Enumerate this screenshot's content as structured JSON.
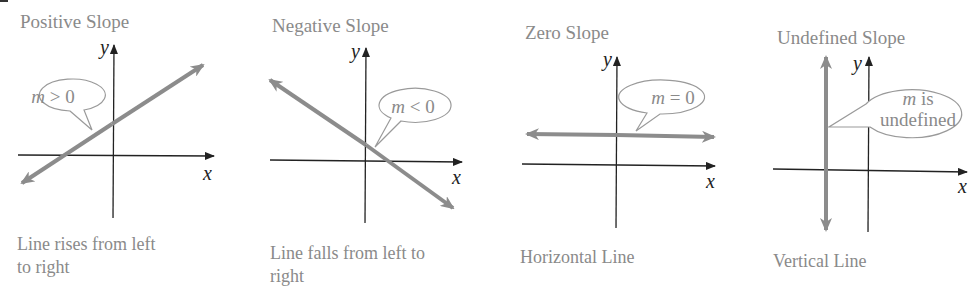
{
  "panels": [
    {
      "title": "Positive Slope",
      "bubble": {
        "var": "m",
        "rel": " > 0"
      },
      "caption_line1": "Line rises from left",
      "caption_line2": "to right",
      "x_label": "x",
      "y_label": "y"
    },
    {
      "title": "Negative Slope",
      "bubble": {
        "var": "m",
        "rel": " < 0"
      },
      "caption_line1": "Line falls from left to",
      "caption_line2": "right",
      "x_label": "x",
      "y_label": "y"
    },
    {
      "title": "Zero Slope",
      "bubble": {
        "var": "m",
        "rel": " = 0"
      },
      "caption_line1": "Horizontal Line",
      "caption_line2": "",
      "x_label": "x",
      "y_label": "y"
    },
    {
      "title": "Undefined Slope",
      "bubble": {
        "var": "m",
        "rel": " is",
        "line2": "undefined"
      },
      "caption_line1": "Vertical Line",
      "caption_line2": "",
      "x_label": "x",
      "y_label": "y"
    }
  ],
  "colors": {
    "axis": "#222222",
    "line": "#8c8c8c",
    "bubble_stroke": "#9a9a9a",
    "text": "#8a8a8a"
  }
}
